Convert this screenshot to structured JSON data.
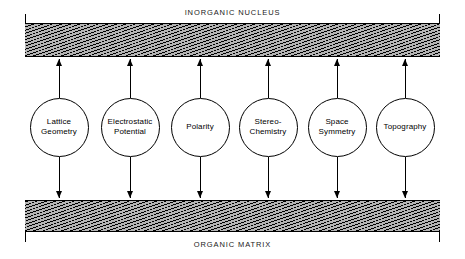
{
  "diagram": {
    "title_top": "INORGANIC NUCLEUS",
    "title_bottom": "ORGANIC MATRIX",
    "bars": [
      {
        "name": "inorganic-nucleus-bar",
        "label": "INORGANIC NUCLEUS",
        "fill": "diagonal-hatch",
        "color": "#b4b4b4"
      },
      {
        "name": "organic-matrix-bar",
        "label": "ORGANIC MATRIX",
        "fill": "diagonal-hatch",
        "color": "#b4b4b4"
      }
    ],
    "factors": [
      {
        "label": "Lattice\nGeometry",
        "cx": 59,
        "r": 29.5
      },
      {
        "label": "Electrostatic\nPotential",
        "cx": 130,
        "r": 29.5
      },
      {
        "label": "Polarity",
        "cx": 200,
        "r": 29.5
      },
      {
        "label": "Stereo-\nChemistry",
        "cx": 268,
        "r": 29.5
      },
      {
        "label": "Space\nSymmetry",
        "cx": 337,
        "r": 29.5
      },
      {
        "label": "Topography",
        "cx": 405,
        "r": 29.5
      }
    ],
    "arrows": {
      "up_direction": "up",
      "down_direction": "down",
      "count_per_factor": 2,
      "note": "Each circle connects upward to the inorganic nucleus and downward to the organic matrix."
    }
  }
}
